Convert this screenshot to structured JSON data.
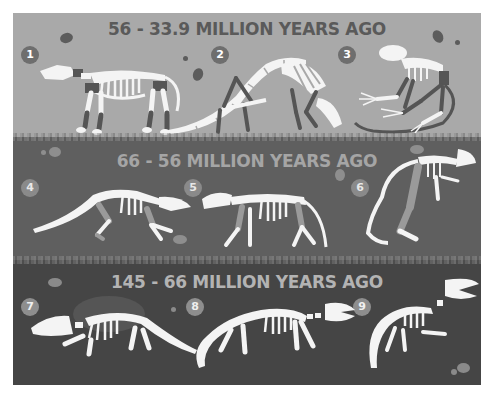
{
  "colors": {
    "band_1_bg": "#a9a9a9",
    "band_2_bg": "#5f5f5f",
    "band_3_bg": "#454545",
    "bone": "#f4f4f4"
  },
  "bands": [
    {
      "title": "56 - 33.9 MILLION YEARS AGO",
      "fossils": [
        {
          "number": "1",
          "icon": "tapir-like-mammal-skeleton-icon"
        },
        {
          "number": "2",
          "icon": "anteater-like-mammal-skeleton-icon"
        },
        {
          "number": "3",
          "icon": "primate-like-mammal-skeleton-icon"
        }
      ]
    },
    {
      "title": "66 - 56 MILLION YEARS AGO",
      "fossils": [
        {
          "number": "4",
          "icon": "lizard-like-mammal-skeleton-icon"
        },
        {
          "number": "5",
          "icon": "rodent-like-mammal-skeleton-icon"
        },
        {
          "number": "6",
          "icon": "hunched-mammal-skeleton-icon"
        }
      ]
    },
    {
      "title": "145 - 66 MILLION YEARS AGO",
      "fossils": [
        {
          "number": "7",
          "icon": "broad-headed-mammal-skeleton-icon"
        },
        {
          "number": "8",
          "icon": "long-tailed-mammal-skeleton-icon"
        },
        {
          "number": "9",
          "icon": "crocodile-headed-reptile-skeleton-icon"
        }
      ]
    }
  ]
}
